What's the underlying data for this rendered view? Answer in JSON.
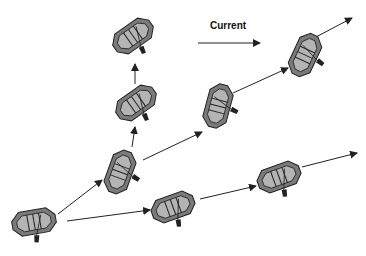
{
  "diagram": {
    "label_current": "Current",
    "colors": {
      "raft_outer": "#7a7a7a",
      "raft_inner": "#b4b4b4",
      "stroke": "#222222",
      "arrow": "#222222"
    },
    "current_arrow": {
      "x1": 198,
      "y1": 43,
      "x2": 260,
      "y2": 43
    },
    "rafts": [
      {
        "id": "raft-start",
        "cx": 34,
        "cy": 222,
        "rot": -10
      },
      {
        "id": "raft-mid-left",
        "cx": 120,
        "cy": 172,
        "rot": -70
      },
      {
        "id": "raft-up-1",
        "cx": 136,
        "cy": 103,
        "rot": -35
      },
      {
        "id": "raft-up-2",
        "cx": 133,
        "cy": 36,
        "rot": -35
      },
      {
        "id": "raft-diag-1",
        "cx": 218,
        "cy": 106,
        "rot": -75
      },
      {
        "id": "raft-diag-2",
        "cx": 305,
        "cy": 55,
        "rot": -65
      },
      {
        "id": "raft-low-1",
        "cx": 173,
        "cy": 207,
        "rot": -20
      },
      {
        "id": "raft-low-2",
        "cx": 279,
        "cy": 177,
        "rot": -20
      }
    ],
    "arrows": [
      {
        "x1": 58,
        "y1": 214,
        "x2": 102,
        "y2": 180
      },
      {
        "x1": 67,
        "y1": 221,
        "x2": 150,
        "y2": 210
      },
      {
        "x1": 132,
        "y1": 147,
        "x2": 135,
        "y2": 127
      },
      {
        "x1": 135,
        "y1": 84,
        "x2": 135,
        "y2": 64
      },
      {
        "x1": 143,
        "y1": 160,
        "x2": 202,
        "y2": 132
      },
      {
        "x1": 233,
        "y1": 93,
        "x2": 288,
        "y2": 68
      },
      {
        "x1": 314,
        "y1": 38,
        "x2": 352,
        "y2": 18
      },
      {
        "x1": 200,
        "y2": 186,
        "y1": 199,
        "x2": 256,
        "y2_": 0
      },
      {
        "x1": 302,
        "y1": 167,
        "x2": 357,
        "y2": 153
      }
    ]
  }
}
